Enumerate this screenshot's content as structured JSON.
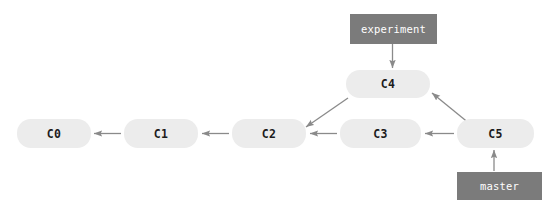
{
  "diagram": {
    "kind": "git-commit-graph",
    "width": 555,
    "height": 209,
    "background_color": "#ffffff",
    "node_fill_color": "#ececec",
    "node_text_color": "#1c1c1c",
    "label_fill_color": "#7b7b7b",
    "label_text_color": "#ffffff",
    "edge_color": "#8a8a8a"
  },
  "commits": [
    {
      "id": "c0",
      "label": "C0",
      "x": 17,
      "y": 119,
      "w": 74,
      "h": 29
    },
    {
      "id": "c1",
      "label": "C1",
      "x": 124,
      "y": 119,
      "w": 74,
      "h": 29
    },
    {
      "id": "c2",
      "label": "C2",
      "x": 232,
      "y": 119,
      "w": 74,
      "h": 29
    },
    {
      "id": "c3",
      "label": "C3",
      "x": 340,
      "y": 119,
      "w": 81,
      "h": 29
    },
    {
      "id": "c4",
      "label": "C4",
      "x": 346,
      "y": 70,
      "w": 84,
      "h": 28
    },
    {
      "id": "c5",
      "label": "C5",
      "x": 457,
      "y": 119,
      "w": 77,
      "h": 29
    }
  ],
  "branches": [
    {
      "id": "experiment",
      "label": "experiment",
      "x": 350,
      "y": 14,
      "w": 87,
      "h": 30,
      "points_to": "c4"
    },
    {
      "id": "master",
      "label": "master",
      "x": 457,
      "y": 172,
      "w": 85,
      "h": 28,
      "points_to": "c5"
    }
  ],
  "edges": [
    {
      "id": "c1-to-c0",
      "from": "c1",
      "to": "c0",
      "kind": "parent-pointer"
    },
    {
      "id": "c2-to-c1",
      "from": "c2",
      "to": "c1",
      "kind": "parent-pointer"
    },
    {
      "id": "c3-to-c2",
      "from": "c3",
      "to": "c2",
      "kind": "parent-pointer"
    },
    {
      "id": "c4-to-c2",
      "from": "c4",
      "to": "c2",
      "kind": "parent-pointer"
    },
    {
      "id": "c5-to-c3",
      "from": "c5",
      "to": "c3",
      "kind": "parent-pointer"
    },
    {
      "id": "c5-to-c4",
      "from": "c5",
      "to": "c4",
      "kind": "parent-pointer"
    },
    {
      "id": "experiment-to-c4",
      "from": "experiment",
      "to": "c4",
      "kind": "branch-pointer"
    },
    {
      "id": "master-to-c5",
      "from": "master",
      "to": "c5",
      "kind": "branch-pointer"
    }
  ]
}
